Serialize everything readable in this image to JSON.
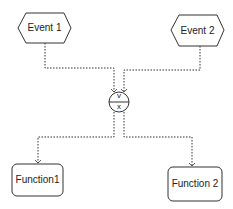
{
  "diagram": {
    "type": "EPC",
    "nodes": {
      "event1": {
        "label": "Event 1",
        "shape": "hexagon"
      },
      "event2": {
        "label": "Event 2",
        "shape": "hexagon"
      },
      "connector": {
        "label_top": "v",
        "label_bottom": "x",
        "shape": "circle"
      },
      "function1": {
        "label": "Function1",
        "shape": "rounded-rect"
      },
      "function2": {
        "label": "Function 2",
        "shape": "rounded-rect"
      }
    },
    "edges": [
      {
        "from": "event1",
        "to": "connector",
        "style": "dotted"
      },
      {
        "from": "event2",
        "to": "connector",
        "style": "dotted"
      },
      {
        "from": "connector",
        "to": "function1",
        "style": "dotted"
      },
      {
        "from": "connector",
        "to": "function2",
        "style": "dotted"
      }
    ],
    "colors": {
      "stroke": "#333333",
      "fill": "#ffffff",
      "text": "#222222"
    }
  }
}
